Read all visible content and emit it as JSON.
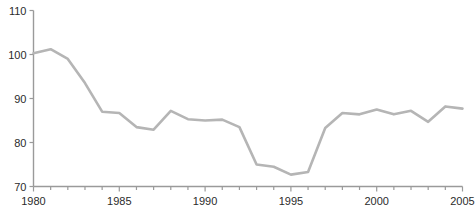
{
  "chart_data": {
    "type": "line",
    "title": "",
    "subtitle": "",
    "xlabel": "",
    "ylabel": "",
    "x": [
      1980,
      1981,
      1982,
      1983,
      1984,
      1985,
      1986,
      1987,
      1988,
      1989,
      1990,
      1991,
      1992,
      1993,
      1994,
      1995,
      1996,
      1997,
      1998,
      1999,
      2000,
      2001,
      2002,
      2003,
      2004,
      2005
    ],
    "values": [
      100.3,
      101.2,
      99.0,
      93.5,
      87.0,
      86.7,
      83.5,
      82.9,
      87.2,
      85.3,
      85.0,
      85.2,
      83.5,
      75.0,
      74.5,
      72.7,
      73.3,
      83.3,
      86.7,
      86.4,
      87.5,
      86.4,
      87.2,
      84.7,
      88.2,
      87.7
    ],
    "series": [
      {
        "name": "series-1",
        "color": "#b5b5b5",
        "values": [
          100.3,
          101.2,
          99.0,
          93.5,
          87.0,
          86.7,
          83.5,
          82.9,
          87.2,
          85.3,
          85.0,
          85.2,
          83.5,
          75.0,
          74.5,
          72.7,
          73.3,
          83.3,
          86.7,
          86.4,
          87.5,
          86.4,
          87.2,
          84.7,
          88.2,
          87.7
        ]
      }
    ],
    "xlim": [
      1980,
      2005
    ],
    "ylim": [
      70,
      110
    ],
    "y_ticks": [
      70,
      80,
      90,
      100,
      110
    ],
    "y_tick_labels": [
      "70",
      "80",
      "90",
      "100",
      "110"
    ],
    "x_ticks": [
      1980,
      1981,
      1982,
      1983,
      1984,
      1985,
      1986,
      1987,
      1988,
      1989,
      1990,
      1991,
      1992,
      1993,
      1994,
      1995,
      1996,
      1997,
      1998,
      1999,
      2000,
      2001,
      2002,
      2003,
      2004,
      2005
    ],
    "x_tick_labels_major": [
      "1980",
      "1985",
      "1990",
      "1995",
      "2000",
      "2005"
    ],
    "x_major_ticks": [
      1980,
      1985,
      1990,
      1995,
      2000,
      2005
    ],
    "grid": false,
    "legend": null,
    "legend_position": "none",
    "axis_color": "#9a9a9a",
    "tick_label_color": "#2b2b2b",
    "background_color": "#ffffff"
  }
}
